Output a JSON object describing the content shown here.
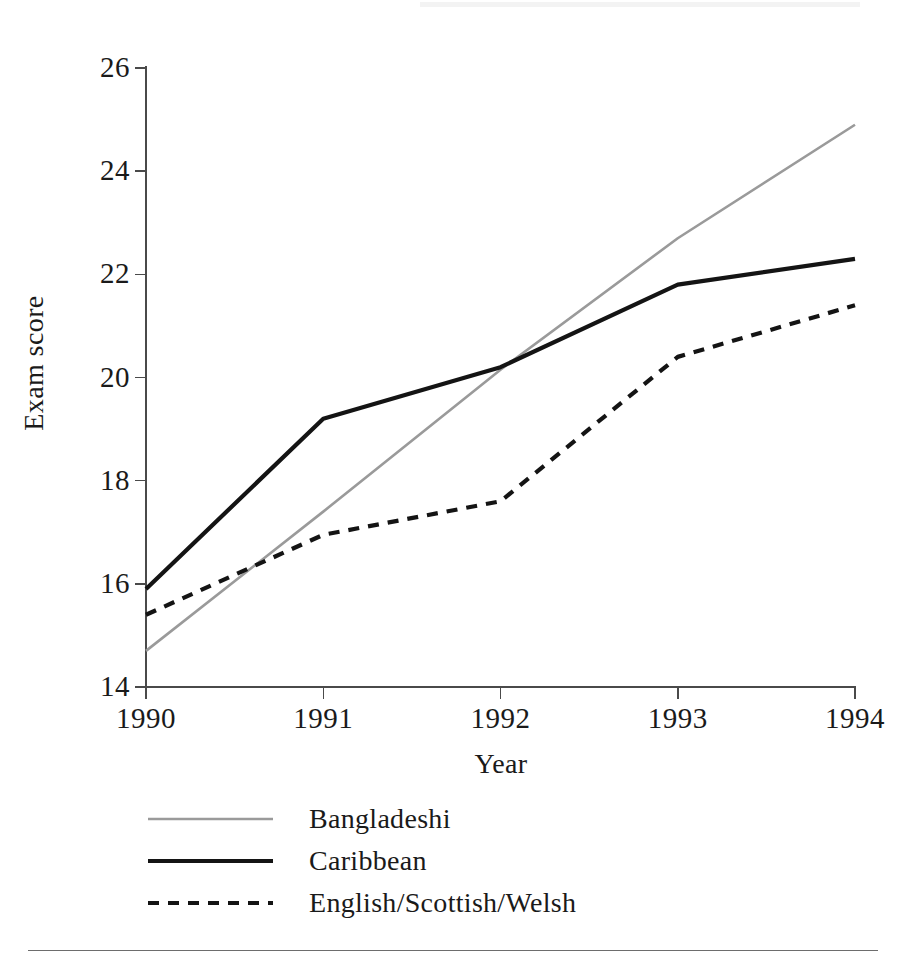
{
  "chart_data": {
    "type": "line",
    "title": "",
    "xlabel": "Year",
    "ylabel": "Exam score",
    "categories": [
      "1990",
      "1991",
      "1992",
      "1993",
      "1994"
    ],
    "x": [
      1990,
      1991,
      1992,
      1993,
      1994
    ],
    "xlim": [
      1990,
      1994
    ],
    "ylim": [
      14,
      26
    ],
    "yticks": [
      "26",
      "24",
      "22",
      "20",
      "18",
      "16",
      "14"
    ],
    "ytick_values": [
      26,
      24,
      22,
      20,
      18,
      16,
      14
    ],
    "xticks": [
      "1990",
      "1991",
      "1992",
      "1993",
      "1994"
    ],
    "grid": false,
    "legend_position": "below-left",
    "series": [
      {
        "name": "Bangladeshi",
        "values": [
          14.7,
          17.4,
          20.15,
          22.7,
          24.9
        ],
        "color": "#9a9a9a",
        "style": "solid",
        "width": 2.6
      },
      {
        "name": "Caribbean",
        "values": [
          15.9,
          19.2,
          20.2,
          21.8,
          22.3
        ],
        "color": "#141414",
        "style": "solid",
        "width": 4.2
      },
      {
        "name": "English/Scottish/Welsh",
        "values": [
          15.4,
          16.95,
          17.6,
          20.4,
          21.4
        ],
        "color": "#141414",
        "style": "dashed",
        "width": 4.2
      }
    ]
  },
  "axes": {
    "y_title": "Exam score",
    "x_title": "Year",
    "y_labels": [
      "26",
      "24",
      "22",
      "20",
      "18",
      "16",
      "14"
    ],
    "x_labels": [
      "1990",
      "1991",
      "1992",
      "1993",
      "1994"
    ]
  },
  "legend": {
    "items": [
      {
        "label": "Bangladeshi"
      },
      {
        "label": "Caribbean"
      },
      {
        "label": "English/Scottish/Welsh"
      }
    ]
  },
  "colors": {
    "series_gray": "#9a9a9a",
    "series_black": "#141414",
    "axis": "#4a4a4a",
    "rule": "#6d6d6d",
    "background": "#ffffff"
  }
}
